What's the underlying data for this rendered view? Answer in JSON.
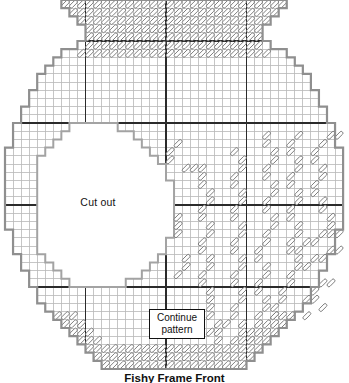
{
  "figure": {
    "cutout_label": "Cut out",
    "continue_label_line1": "Continue",
    "continue_label_line2": "pattern",
    "caption": "Fishy Frame Front"
  },
  "colors": {
    "background": "#ffffff",
    "grid_line": "#b8b8b8",
    "bold_line": "#2b2b2b",
    "outline": "#8f8f8f",
    "cutout_outline": "#a3a3a3",
    "stitch_outline": "#6f6f6f",
    "stitch_fill": "#ffffff",
    "text": "#111111"
  },
  "pattern": {
    "grid": {
      "origin_x": 5,
      "origin_y": 0,
      "cell_w": 8.05,
      "cell_h": 8.2,
      "cols": 42,
      "rows": 45,
      "bold_rows": [
        5,
        15,
        25,
        35
      ],
      "bold_cols": [
        10,
        20,
        30
      ]
    },
    "shape_rows": [
      [
        7,
        34
      ],
      [
        8,
        33
      ],
      [
        9,
        32
      ],
      [
        10,
        31
      ],
      [
        10,
        31
      ],
      [
        9,
        32
      ],
      [
        7,
        34
      ],
      [
        6,
        35
      ],
      [
        5,
        36
      ],
      [
        4,
        37
      ],
      [
        4,
        37
      ],
      [
        3,
        38
      ],
      [
        3,
        38
      ],
      [
        2,
        39
      ],
      [
        2,
        39
      ],
      [
        1,
        40
      ],
      [
        1,
        40
      ],
      [
        1,
        40
      ],
      [
        0,
        41
      ],
      [
        0,
        41
      ],
      [
        0,
        41
      ],
      [
        0,
        41
      ],
      [
        0,
        41
      ],
      [
        0,
        41
      ],
      [
        0,
        41
      ],
      [
        0,
        41
      ],
      [
        0,
        41
      ],
      [
        0,
        41
      ],
      [
        1,
        40
      ],
      [
        1,
        40
      ],
      [
        1,
        40
      ],
      [
        2,
        39
      ],
      [
        2,
        39
      ],
      [
        3,
        38
      ],
      [
        3,
        38
      ],
      [
        4,
        37
      ],
      [
        4,
        37
      ],
      [
        5,
        36
      ],
      [
        6,
        35
      ],
      [
        7,
        34
      ],
      [
        8,
        33
      ],
      [
        9,
        32
      ],
      [
        10,
        31
      ],
      [
        11,
        30
      ],
      [
        12,
        29
      ]
    ],
    "cutout_first_row": 15,
    "cutout_rows": [
      [
        15,
        8,
        13
      ],
      [
        16,
        7,
        15
      ],
      [
        17,
        6,
        16
      ],
      [
        18,
        5,
        17
      ],
      [
        19,
        4,
        18
      ],
      [
        20,
        4,
        19
      ],
      [
        21,
        4,
        19
      ],
      [
        22,
        4,
        20
      ],
      [
        23,
        4,
        20
      ],
      [
        24,
        4,
        20
      ],
      [
        25,
        4,
        20
      ],
      [
        26,
        4,
        20
      ],
      [
        27,
        4,
        20
      ],
      [
        28,
        4,
        20
      ],
      [
        29,
        4,
        19
      ],
      [
        30,
        4,
        19
      ],
      [
        31,
        5,
        18
      ],
      [
        32,
        6,
        17
      ],
      [
        33,
        7,
        16
      ],
      [
        34,
        8,
        14
      ]
    ],
    "rim_stitch_rows": [
      [
        0,
        7,
        34
      ],
      [
        1,
        8,
        33
      ],
      [
        2,
        9,
        32
      ],
      [
        3,
        10,
        31
      ],
      [
        4,
        10,
        31
      ],
      [
        5,
        10,
        31
      ],
      [
        6,
        9,
        32
      ]
    ],
    "bottom_stitch_rows": [
      [
        42,
        10,
        31
      ],
      [
        43,
        11,
        30
      ],
      [
        44,
        12,
        29
      ]
    ],
    "edge_bands": [
      [
        38,
        6,
        8,
        33,
        35
      ],
      [
        39,
        7,
        9,
        32,
        34
      ],
      [
        40,
        8,
        10,
        31,
        33
      ],
      [
        41,
        9,
        11,
        30,
        32
      ]
    ],
    "strands": [
      [
        [
          21,
          17
        ],
        [
          20,
          18
        ],
        [
          20,
          19
        ],
        [
          22,
          20
        ],
        [
          23,
          20
        ]
      ],
      [
        [
          21,
          26
        ],
        [
          21,
          27
        ],
        [
          21,
          28
        ],
        [
          22,
          31
        ],
        [
          22,
          32
        ],
        [
          21,
          33
        ]
      ],
      [
        [
          24,
          20
        ],
        [
          24,
          21
        ],
        [
          24,
          22
        ],
        [
          25,
          23
        ],
        [
          25,
          24
        ],
        [
          24,
          25
        ],
        [
          24,
          26
        ],
        [
          25,
          27
        ],
        [
          25,
          28
        ],
        [
          24,
          29
        ],
        [
          24,
          30
        ],
        [
          25,
          31
        ],
        [
          25,
          32
        ],
        [
          24,
          33
        ],
        [
          24,
          34
        ],
        [
          25,
          35
        ],
        [
          25,
          36
        ],
        [
          25,
          37
        ],
        [
          25,
          38
        ],
        [
          26,
          39
        ],
        [
          27,
          39
        ],
        [
          25,
          40
        ],
        [
          26,
          40
        ],
        [
          26,
          41
        ]
      ],
      [
        [
          28,
          18
        ],
        [
          29,
          19
        ],
        [
          29,
          20
        ],
        [
          28,
          21
        ],
        [
          28,
          22
        ],
        [
          29,
          23
        ],
        [
          29,
          24
        ],
        [
          28,
          25
        ],
        [
          28,
          26
        ],
        [
          29,
          27
        ],
        [
          29,
          28
        ],
        [
          28,
          29
        ],
        [
          28,
          30
        ],
        [
          29,
          31
        ],
        [
          29,
          32
        ],
        [
          28,
          33
        ],
        [
          28,
          34
        ],
        [
          29,
          35
        ],
        [
          29,
          36
        ],
        [
          28,
          37
        ],
        [
          28,
          38
        ],
        [
          29,
          39
        ],
        [
          29,
          40
        ],
        [
          28,
          41
        ],
        [
          29,
          41
        ]
      ],
      [
        [
          32,
          16
        ],
        [
          32,
          17
        ],
        [
          33,
          18
        ],
        [
          33,
          19
        ],
        [
          32,
          20
        ],
        [
          32,
          21
        ],
        [
          33,
          22
        ],
        [
          33,
          23
        ],
        [
          32,
          24
        ],
        [
          32,
          25
        ],
        [
          33,
          26
        ],
        [
          33,
          27
        ],
        [
          32,
          28
        ],
        [
          32,
          29
        ],
        [
          31,
          30
        ],
        [
          31,
          31
        ],
        [
          32,
          32
        ],
        [
          32,
          33
        ],
        [
          31,
          34
        ],
        [
          31,
          35
        ],
        [
          32,
          36
        ],
        [
          32,
          37
        ],
        [
          31,
          38
        ],
        [
          31,
          39
        ],
        [
          30,
          40
        ],
        [
          30,
          41
        ]
      ],
      [
        [
          36,
          16
        ],
        [
          35,
          17
        ],
        [
          35,
          18
        ],
        [
          36,
          19
        ],
        [
          36,
          20
        ],
        [
          35,
          21
        ],
        [
          35,
          22
        ],
        [
          36,
          23
        ],
        [
          36,
          24
        ],
        [
          35,
          25
        ],
        [
          35,
          26
        ],
        [
          36,
          27
        ],
        [
          36,
          28
        ],
        [
          35,
          29
        ],
        [
          35,
          30
        ],
        [
          36,
          31
        ],
        [
          36,
          32
        ],
        [
          35,
          33
        ],
        [
          35,
          34
        ],
        [
          34,
          35
        ],
        [
          34,
          36
        ],
        [
          33,
          37
        ],
        [
          33,
          38
        ]
      ],
      [
        [
          40,
          16
        ],
        [
          41,
          16
        ],
        [
          39,
          17
        ],
        [
          38,
          18
        ],
        [
          38,
          19
        ],
        [
          39,
          20
        ],
        [
          39,
          21
        ],
        [
          38,
          22
        ],
        [
          38,
          23
        ],
        [
          39,
          24
        ],
        [
          39,
          25
        ],
        [
          40,
          26
        ],
        [
          40,
          27
        ],
        [
          41,
          28
        ]
      ],
      [
        [
          36,
          30
        ],
        [
          37,
          29
        ],
        [
          38,
          29
        ],
        [
          39,
          28
        ],
        [
          40,
          28
        ]
      ],
      [
        [
          37,
          32
        ],
        [
          38,
          31
        ],
        [
          39,
          31
        ],
        [
          40,
          30
        ],
        [
          41,
          30
        ]
      ],
      [
        [
          38,
          35
        ],
        [
          39,
          34
        ],
        [
          40,
          34
        ],
        [
          37,
          36
        ],
        [
          38,
          36
        ],
        [
          39,
          37
        ],
        [
          37,
          38
        ]
      ]
    ]
  }
}
